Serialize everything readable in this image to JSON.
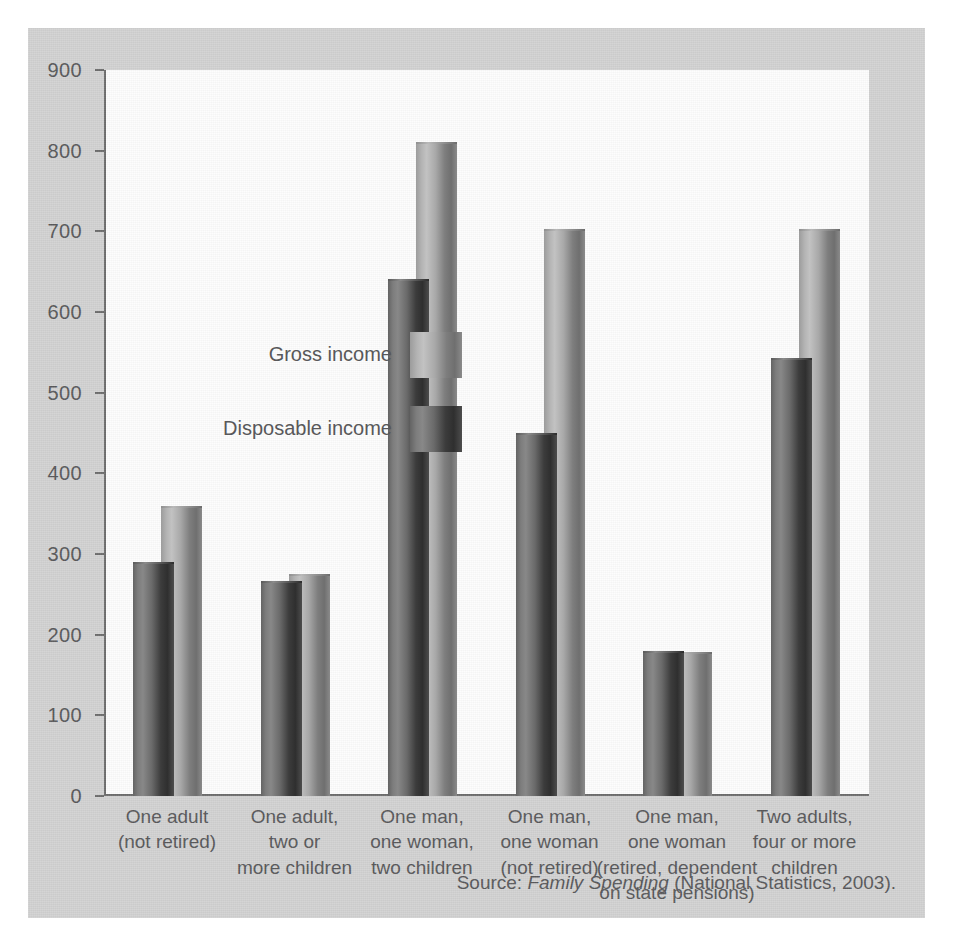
{
  "chart_data": {
    "type": "bar",
    "title": "",
    "xlabel": "",
    "ylabel": "",
    "ylim": [
      0,
      900
    ],
    "yticks": [
      0,
      100,
      200,
      300,
      400,
      500,
      600,
      700,
      800,
      900
    ],
    "grid": false,
    "legend_position": "inside-upper-left",
    "categories": [
      "One adult\n(not retired)",
      "One adult,\ntwo or\nmore children",
      "One man,\none woman,\ntwo children",
      "One man,\none woman\n(not retired)",
      "One man,\none woman\n(retired, dependent\non state pensions)",
      "Two adults,\nfour or more\nchildren"
    ],
    "series": [
      {
        "name": "Disposable income",
        "values": [
          290,
          266,
          641,
          450,
          180,
          543
        ]
      },
      {
        "name": "Gross income",
        "values": [
          360,
          275,
          811,
          703,
          179,
          703
        ]
      }
    ],
    "source_prefix": "Source: ",
    "source_title": "Family Spending",
    "source_suffix": " (National Statistics, 2003)."
  },
  "legend": {
    "gross_label": "Gross income",
    "disposable_label": "Disposable\nincome"
  },
  "colors": {
    "panel": "#d2d2d2",
    "plot_background": "#fdfdfd",
    "axis": "#6d6d6d",
    "text": "#58585a",
    "gross_bar": "#a8a8a8",
    "disposable_bar": "#4d4d4d"
  }
}
